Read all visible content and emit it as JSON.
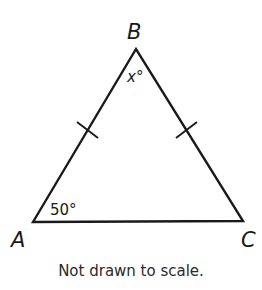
{
  "figure": {
    "vertices": {
      "A": {
        "label": "A",
        "x": 33,
        "y": 222
      },
      "B": {
        "label": "B",
        "x": 136,
        "y": 49
      },
      "C": {
        "label": "C",
        "x": 243,
        "y": 221
      }
    },
    "angles": {
      "A": "50°",
      "B": "x°"
    },
    "congruent_sides": [
      "AB",
      "BC"
    ],
    "line_color": "#1a1a1a",
    "caption": "Not drawn to scale."
  }
}
